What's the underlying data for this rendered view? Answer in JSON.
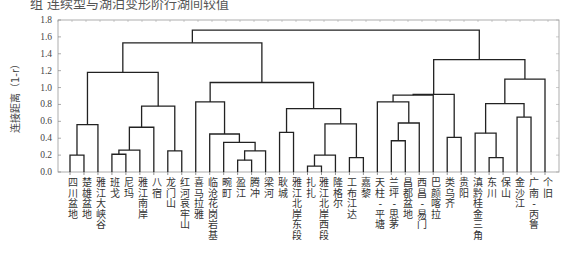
{
  "caption": "组  连续型与湖泊变形阶行湖间较值",
  "chart_data": {
    "type": "dendrogram",
    "title": "",
    "xlabel": "",
    "ylabel": "连接距离（1-r）",
    "ylim": [
      0,
      1.8
    ],
    "yticks": [
      "0.0",
      "0.2",
      "0.4",
      "0.6",
      "0.8",
      "1.0",
      "1.2",
      "1.4",
      "1.6",
      "1.8"
    ],
    "grid": false,
    "leaves": [
      "四川盆地",
      "楚雄盆地",
      "雅江大峡谷",
      "班戈",
      "尼玛",
      "雅江南岸",
      "八宿",
      "龙门山",
      "红河哀牢山",
      "喜马拉雅",
      "临沧花岗岩基",
      "畹町",
      "盈江",
      "腾冲",
      "梁河",
      "耿城",
      "雅江北岸东段",
      "扎扎",
      "雅江北岸西段",
      "隆格尔",
      "工布江达",
      "嘉黎",
      "天柱-平塘",
      "兰坪-思茅",
      "昌都盆地",
      "西昌-易门",
      "巴颜喀拉",
      "类乌齐",
      "贵阳",
      "滇黔桂金三角",
      "东川",
      "保山",
      "金沙江",
      "广南-丙鲁",
      "个旧"
    ],
    "merges": [
      {
        "id": "A",
        "children": [
          0,
          1
        ],
        "height": 0.2
      },
      {
        "id": "B",
        "children": [
          "A",
          2
        ],
        "height": 0.56
      },
      {
        "id": "C",
        "children": [
          3,
          4
        ],
        "height": 0.21
      },
      {
        "id": "D",
        "children": [
          "C",
          5
        ],
        "height": 0.26
      },
      {
        "id": "E",
        "children": [
          "D",
          6
        ],
        "height": 0.53
      },
      {
        "id": "F",
        "children": [
          7,
          8
        ],
        "height": 0.25
      },
      {
        "id": "G",
        "children": [
          "E",
          "F"
        ],
        "height": 0.78
      },
      {
        "id": "H",
        "children": [
          "B",
          "G"
        ],
        "height": 1.18
      },
      {
        "id": "I",
        "children": [
          12,
          13
        ],
        "height": 0.14
      },
      {
        "id": "J",
        "children": [
          "I",
          14
        ],
        "height": 0.25
      },
      {
        "id": "K",
        "children": [
          11,
          "J"
        ],
        "height": 0.35
      },
      {
        "id": "L",
        "children": [
          10,
          "K"
        ],
        "height": 0.45
      },
      {
        "id": "M",
        "children": [
          9,
          "L"
        ],
        "height": 0.83
      },
      {
        "id": "N",
        "children": [
          17,
          18
        ],
        "height": 0.07
      },
      {
        "id": "O",
        "children": [
          "N",
          19
        ],
        "height": 0.2
      },
      {
        "id": "P",
        "children": [
          15,
          16
        ],
        "height": 0.47
      },
      {
        "id": "Q",
        "children": [
          20,
          21
        ],
        "height": 0.17
      },
      {
        "id": "R",
        "children": [
          "O",
          "Q"
        ],
        "height": 0.57
      },
      {
        "id": "S",
        "children": [
          "P",
          "R"
        ],
        "height": 0.75
      },
      {
        "id": "T",
        "children": [
          "M",
          "S"
        ],
        "height": 1.06
      },
      {
        "id": "U",
        "children": [
          "H",
          "T"
        ],
        "height": 1.53
      },
      {
        "id": "V",
        "children": [
          23,
          24
        ],
        "height": 0.37
      },
      {
        "id": "W",
        "children": [
          "V",
          25
        ],
        "height": 0.58
      },
      {
        "id": "X",
        "children": [
          22,
          "W"
        ],
        "height": 0.83
      },
      {
        "id": "Y",
        "children": [
          "X",
          26
        ],
        "height": 0.91
      },
      {
        "id": "Z",
        "children": [
          27,
          28
        ],
        "height": 0.41
      },
      {
        "id": "AA",
        "children": [
          "Y",
          "Z"
        ],
        "height": 0.92
      },
      {
        "id": "AB",
        "children": [
          30,
          31
        ],
        "height": 0.17
      },
      {
        "id": "AC",
        "children": [
          29,
          "AB"
        ],
        "height": 0.46
      },
      {
        "id": "AD",
        "children": [
          32,
          33
        ],
        "height": 0.65
      },
      {
        "id": "AE",
        "children": [
          "AC",
          "AD"
        ],
        "height": 0.81
      },
      {
        "id": "AF",
        "children": [
          "AE",
          34
        ],
        "height": 1.1
      },
      {
        "id": "AG",
        "children": [
          "AA",
          "AF"
        ],
        "height": 1.33
      },
      {
        "id": "AH",
        "children": [
          "U",
          "AG"
        ],
        "height": 1.68
      }
    ]
  }
}
